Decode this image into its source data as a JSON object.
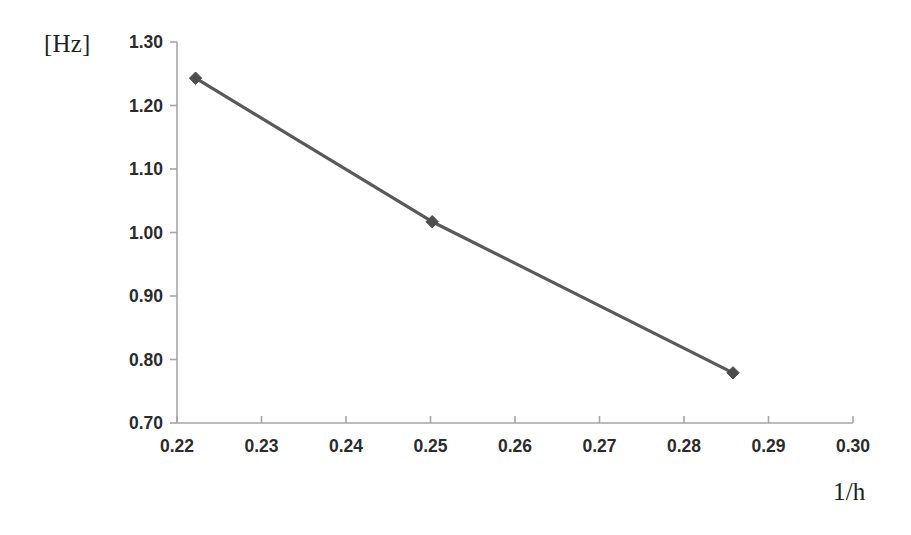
{
  "chart_data": {
    "type": "line",
    "title": "",
    "subtitle": "",
    "xlabel": "1/h",
    "ylabel": "[Hz]",
    "ylabel_position": "top-left",
    "grid": false,
    "legend": false,
    "legend_position": "none",
    "xlim": [
      0.22,
      0.3
    ],
    "ylim": [
      0.7,
      1.3
    ],
    "xticks": [
      0.22,
      0.23,
      0.24,
      0.25,
      0.26,
      0.27,
      0.28,
      0.29,
      0.3
    ],
    "yticks": [
      0.7,
      0.8,
      0.9,
      1.0,
      1.1,
      1.2,
      1.3
    ],
    "xtick_labels": [
      "0.22",
      "0.23",
      "0.24",
      "0.25",
      "0.26",
      "0.27",
      "0.28",
      "0.29",
      "0.30"
    ],
    "ytick_labels": [
      "0.70",
      "0.80",
      "0.90",
      "1.00",
      "1.10",
      "1.20",
      "1.30"
    ],
    "series": [
      {
        "name": "frequency",
        "marker": "diamond",
        "color": "#595959",
        "x": [
          0.2222,
          0.2502,
          0.2858
        ],
        "y": [
          1.243,
          1.017,
          0.779
        ]
      }
    ]
  },
  "labels": {
    "y_unit": "[Hz]",
    "x_axis_title": "1/h"
  },
  "style": {
    "line_color": "#595959",
    "marker_color": "#4d4d4d",
    "axis_color": "#a6a6a6",
    "tick_text_color": "#2b2b2b",
    "label_text_color": "#231f20",
    "background": "#ffffff"
  }
}
